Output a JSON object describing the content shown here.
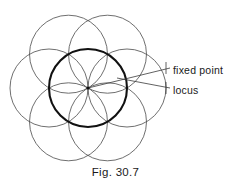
{
  "figure": {
    "caption": "Fig. 30.7",
    "labels": {
      "fixed_point": "fixed point",
      "locus": "locus"
    },
    "colors": {
      "thin_stroke": "#4a4a4a",
      "bold_stroke": "#111111",
      "leader_stroke": "#3a3a3a",
      "background": "#ffffff",
      "text": "#1a1a1a"
    },
    "geometry": {
      "center_x": 88,
      "center_y": 88,
      "radius": 39,
      "outer_circle_count": 6,
      "bold_circle_stroke_width": 2.1,
      "thin_circle_stroke_width": 0.8,
      "outer_centers": [
        {
          "x": 127,
          "y": 88
        },
        {
          "x": 107.5,
          "y": 54.2
        },
        {
          "x": 68.5,
          "y": 54.2
        },
        {
          "x": 49,
          "y": 88
        },
        {
          "x": 68.5,
          "y": 121.8
        },
        {
          "x": 107.5,
          "y": 121.8
        }
      ],
      "leaders": [
        {
          "name": "fixed-point-leader",
          "x1": 88,
          "y1": 88,
          "x2": 170,
          "y2": 68
        },
        {
          "name": "locus-leader",
          "x1": 117,
          "y1": 78,
          "x2": 170,
          "y2": 88
        }
      ],
      "leader_ticks": [
        {
          "name": "fixed-point-tick",
          "x": 166,
          "y1": 62,
          "y2": 74
        },
        {
          "name": "locus-tick",
          "x": 166,
          "y1": 82,
          "y2": 94
        }
      ]
    }
  }
}
